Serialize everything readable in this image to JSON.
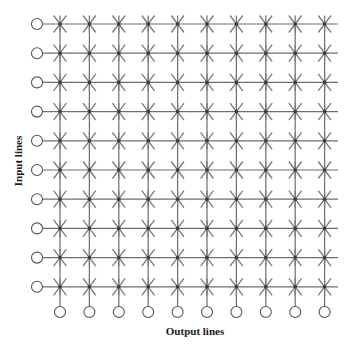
{
  "diagram": {
    "input_label": "Input lines",
    "output_label": "Output lines",
    "rows": 10,
    "cols": 10,
    "crosspoint_symbol": "asterisk-with-dot",
    "colors": {
      "line": "#6e6e6e",
      "star": "#7a7a7a",
      "dot": "#3a3a3a",
      "circle_stroke": "#555555",
      "text": "#1a1a1a"
    },
    "geometry": {
      "first_col_x": 60,
      "col_spacing": 29.4,
      "first_row_y": 24,
      "row_spacing": 29.2,
      "input_circle_x": 37,
      "output_circle_y": 312,
      "line_end_x": 338,
      "circle_r": 5.5,
      "star_r": 8.5
    }
  }
}
